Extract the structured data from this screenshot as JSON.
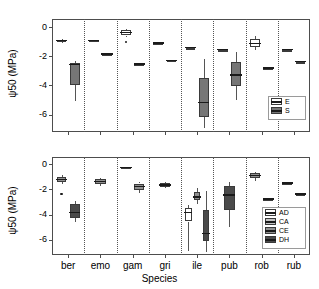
{
  "figure": {
    "width": 319,
    "height": 289,
    "background": "#ffffff",
    "axis_color": "#4d4d4d",
    "separator_style": "dotted"
  },
  "chart_data": {
    "type": "box",
    "title": "",
    "xlabel": "Species",
    "ylabel": "ψ50 (MPa)",
    "categories": [
      "ber",
      "emo",
      "gam",
      "gri",
      "ile",
      "pub",
      "rob",
      "rub"
    ],
    "ylim": [
      -7.2,
      0.55
    ],
    "yticks": [
      0,
      -2,
      -4,
      -6
    ],
    "ytick_labels": [
      "0",
      "-2",
      "-4",
      "-6"
    ],
    "grid": false,
    "panels": [
      {
        "id": "top",
        "legend_title": "",
        "legend_position": "bottom-right",
        "groups": [
          "E",
          "S"
        ],
        "group_colors": {
          "E": "#ffffff",
          "S": "#767676"
        },
        "legend_entries": [
          {
            "label": "E",
            "color": "#ffffff"
          },
          {
            "label": "S",
            "color": "#767676"
          }
        ],
        "boxes": [
          {
            "category": "ber",
            "group": "E",
            "min": -1.12,
            "q1": -1.05,
            "median": -0.93,
            "q3": -0.86,
            "max": -0.8,
            "outliers": []
          },
          {
            "category": "ber",
            "group": "S",
            "min": -5.1,
            "q1": -3.95,
            "median": -2.58,
            "q3": -2.45,
            "max": -2.36,
            "outliers": []
          },
          {
            "category": "emo",
            "group": "E",
            "min": -0.92,
            "q1": -0.92,
            "median": -0.92,
            "q3": -0.92,
            "max": -0.92,
            "outliers": []
          },
          {
            "category": "emo",
            "group": "S",
            "min": -1.85,
            "q1": -1.85,
            "median": -1.85,
            "q3": -1.85,
            "max": -1.85,
            "outliers": []
          },
          {
            "category": "gam",
            "group": "E",
            "min": -0.7,
            "q1": -0.58,
            "median": -0.38,
            "q3": -0.22,
            "max": -0.13,
            "outliers": [
              -1.02
            ]
          },
          {
            "category": "gam",
            "group": "S",
            "min": -2.52,
            "q1": -2.52,
            "median": -2.52,
            "q3": -2.52,
            "max": -2.52,
            "outliers": []
          },
          {
            "category": "gri",
            "group": "E",
            "min": -1.08,
            "q1": -1.08,
            "median": -1.08,
            "q3": -1.08,
            "max": -1.08,
            "outliers": []
          },
          {
            "category": "gri",
            "group": "S",
            "min": -2.28,
            "q1": -2.28,
            "median": -2.28,
            "q3": -2.28,
            "max": -2.28,
            "outliers": []
          },
          {
            "category": "ile",
            "group": "E",
            "min": -1.42,
            "q1": -1.42,
            "median": -1.42,
            "q3": -1.42,
            "max": -1.42,
            "outliers": []
          },
          {
            "category": "ile",
            "group": "S",
            "min": -6.95,
            "q1": -6.18,
            "median": -5.18,
            "q3": -3.48,
            "max": -2.18,
            "outliers": []
          },
          {
            "category": "pub",
            "group": "E",
            "min": -1.55,
            "q1": -1.55,
            "median": -1.55,
            "q3": -1.55,
            "max": -1.55,
            "outliers": []
          },
          {
            "category": "pub",
            "group": "S",
            "min": -4.98,
            "q1": -4.05,
            "median": -3.28,
            "q3": -2.42,
            "max": -1.72,
            "outliers": []
          },
          {
            "category": "rob",
            "group": "E",
            "min": -1.55,
            "q1": -1.38,
            "median": -1.12,
            "q3": -0.82,
            "max": -0.62,
            "outliers": []
          },
          {
            "category": "rob",
            "group": "S",
            "min": -2.82,
            "q1": -2.82,
            "median": -2.82,
            "q3": -2.82,
            "max": -2.82,
            "outliers": []
          },
          {
            "category": "rub",
            "group": "E",
            "min": -1.55,
            "q1": -1.55,
            "median": -1.55,
            "q3": -1.55,
            "max": -1.55,
            "outliers": []
          },
          {
            "category": "rub",
            "group": "S",
            "min": -2.38,
            "q1": -2.38,
            "median": -2.38,
            "q3": -2.38,
            "max": -2.38,
            "outliers": []
          }
        ]
      },
      {
        "id": "bottom",
        "legend_title": "",
        "legend_position": "bottom-right",
        "groups": [
          "AD",
          "CA",
          "CE",
          "DH"
        ],
        "group_colors": {
          "AD": "#ffffff",
          "CA": "#c4c4c4",
          "CE": "#8f8f8f",
          "DH": "#4a4a4a"
        },
        "legend_entries": [
          {
            "label": "AD",
            "color": "#ffffff"
          },
          {
            "label": "CA",
            "color": "#c4c4c4"
          },
          {
            "label": "CE",
            "color": "#8f8f8f"
          },
          {
            "label": "DH",
            "color": "#4a4a4a"
          }
        ],
        "boxes": [
          {
            "category": "ber",
            "group": "CE",
            "min": -1.62,
            "q1": -1.42,
            "median": -1.22,
            "q3": -1.0,
            "max": -0.88,
            "outliers": [
              -2.38
            ]
          },
          {
            "category": "ber",
            "group": "DH",
            "min": -4.62,
            "q1": -4.3,
            "median": -3.85,
            "q3": -3.18,
            "max": -2.92,
            "outliers": []
          },
          {
            "category": "emo",
            "group": "CE",
            "min": -1.72,
            "q1": -1.58,
            "median": -1.38,
            "q3": -1.22,
            "max": -1.12,
            "outliers": []
          },
          {
            "category": "gam",
            "group": "CA",
            "min": -0.38,
            "q1": -0.35,
            "median": -0.28,
            "q3": -0.2,
            "max": -0.18,
            "outliers": []
          },
          {
            "category": "gam",
            "group": "CE",
            "min": -2.28,
            "q1": -2.05,
            "median": -1.78,
            "q3": -1.55,
            "max": -1.42,
            "outliers": []
          },
          {
            "category": "gri",
            "group": "CE",
            "min": -1.92,
            "q1": -1.8,
            "median": -1.65,
            "q3": -1.5,
            "max": -1.42,
            "outliers": []
          },
          {
            "category": "ile",
            "group": "AD",
            "min": -6.85,
            "q1": -4.55,
            "median": -3.82,
            "q3": -3.45,
            "max": -3.25,
            "outliers": []
          },
          {
            "category": "ile",
            "group": "CE",
            "min": -3.2,
            "q1": -2.88,
            "median": -2.62,
            "q3": -2.2,
            "max": -1.92,
            "outliers": []
          },
          {
            "category": "ile",
            "group": "DH",
            "min": -6.98,
            "q1": -6.12,
            "median": -5.48,
            "q3": -3.62,
            "max": -2.15,
            "outliers": []
          },
          {
            "category": "pub",
            "group": "DH",
            "min": -4.98,
            "q1": -3.62,
            "median": -2.45,
            "q3": -1.72,
            "max": -1.42,
            "outliers": []
          },
          {
            "category": "rob",
            "group": "CE",
            "min": -1.32,
            "q1": -1.12,
            "median": -0.92,
            "q3": -0.72,
            "max": -0.62,
            "outliers": []
          },
          {
            "category": "rob",
            "group": "DH",
            "min": -2.78,
            "q1": -2.78,
            "median": -2.78,
            "q3": -2.78,
            "max": -2.78,
            "outliers": []
          },
          {
            "category": "rub",
            "group": "CE",
            "min": -1.52,
            "q1": -1.52,
            "median": -1.52,
            "q3": -1.52,
            "max": -1.52,
            "outliers": []
          },
          {
            "category": "rub",
            "group": "DH",
            "min": -2.38,
            "q1": -2.38,
            "median": -2.38,
            "q3": -2.38,
            "max": -2.38,
            "outliers": []
          }
        ]
      }
    ]
  }
}
